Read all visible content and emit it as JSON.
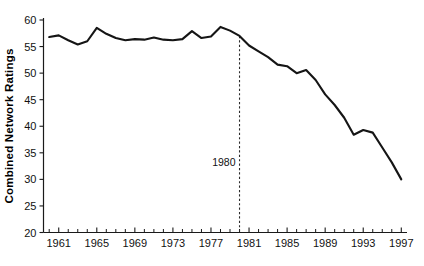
{
  "chart_data": {
    "type": "line",
    "title": "",
    "xlabel": "",
    "ylabel": "Combined Network Ratings",
    "xlim": [
      1959.4,
      1997.6
    ],
    "ylim": [
      20,
      60
    ],
    "grid": false,
    "legend": "none",
    "y_ticks": [
      20,
      25,
      30,
      35,
      40,
      45,
      50,
      55,
      60
    ],
    "y_tick_labels": [
      "20",
      "25",
      "30",
      "35",
      "40",
      "45",
      "50",
      "55",
      "60"
    ],
    "x_ticks": [
      1960,
      1961,
      1962,
      1963,
      1964,
      1965,
      1966,
      1967,
      1968,
      1969,
      1970,
      1971,
      1972,
      1973,
      1974,
      1975,
      1976,
      1977,
      1978,
      1979,
      1980,
      1981,
      1982,
      1983,
      1984,
      1985,
      1986,
      1987,
      1988,
      1989,
      1990,
      1991,
      1992,
      1993,
      1994,
      1995,
      1996,
      1997
    ],
    "x_tick_labels": [
      "1961",
      "1965",
      "1969",
      "1973",
      "1977",
      "1981",
      "1985",
      "1989",
      "1993",
      "1997"
    ],
    "x_tick_label_years": [
      1961,
      1965,
      1969,
      1973,
      1977,
      1981,
      1985,
      1989,
      1993,
      1997
    ],
    "x": [
      1960,
      1961,
      1962,
      1963,
      1964,
      1965,
      1966,
      1967,
      1968,
      1969,
      1970,
      1971,
      1972,
      1973,
      1974,
      1975,
      1976,
      1977,
      1978,
      1979,
      1980,
      1981,
      1982,
      1983,
      1984,
      1985,
      1986,
      1987,
      1988,
      1989,
      1990,
      1991,
      1992,
      1993,
      1994,
      1995,
      1996,
      1997
    ],
    "values": [
      56.8,
      57.1,
      56.2,
      55.4,
      56.0,
      58.5,
      57.4,
      56.6,
      56.2,
      56.4,
      56.3,
      56.7,
      56.3,
      56.2,
      56.4,
      57.9,
      56.6,
      56.9,
      58.7,
      58.0,
      57.0,
      55.2,
      54.1,
      53.0,
      51.6,
      51.3,
      50.0,
      50.6,
      48.7,
      46.0,
      44.0,
      41.6,
      38.4,
      39.3,
      38.8,
      36.0,
      33.2,
      30.0
    ],
    "series_name": "Combined Network Ratings",
    "annotations": [
      {
        "name": "year-marker",
        "label": "1980",
        "x": 1980,
        "y_top": 57.0,
        "y_bottom": 20,
        "style": "dashed-vertical"
      }
    ],
    "colors": {
      "line": "#151515",
      "axis": "#1a1a1a",
      "marker": "#2a2a2a",
      "background": "#ffffff",
      "text": "#111111"
    }
  }
}
